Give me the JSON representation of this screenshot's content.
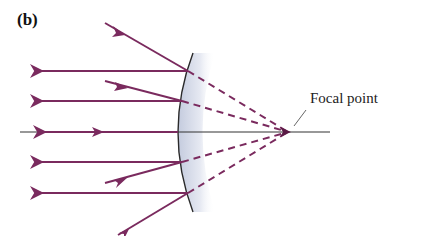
{
  "diagram": {
    "panel_label": "(b)",
    "focal_label": "Focal point",
    "colors": {
      "ray": "#7a2a5e",
      "axis": "#333333",
      "mirror_edge": "#2a2a2a",
      "mirror_fill_start": "#c9cfe0",
      "mirror_fill_end": "#ffffff"
    },
    "focal_point": [
      288,
      132
    ],
    "rays": [
      {
        "incident_start": [
          105,
          23
        ],
        "hit": [
          188,
          71
        ],
        "reflected_end": [
          37,
          71
        ]
      },
      {
        "incident_start": [
          105,
          81
        ],
        "hit": [
          182,
          101
        ],
        "reflected_end": [
          37,
          101
        ]
      },
      {
        "incident_start": [
          20,
          132
        ],
        "hit": [
          178,
          132
        ],
        "reflected_end": [
          20,
          132
        ]
      },
      {
        "incident_start": [
          105,
          183
        ],
        "hit": [
          182,
          162
        ],
        "reflected_end": [
          37,
          162
        ]
      },
      {
        "incident_start": [
          118,
          235
        ],
        "hit": [
          188,
          193
        ],
        "reflected_end": [
          37,
          193
        ]
      }
    ]
  }
}
